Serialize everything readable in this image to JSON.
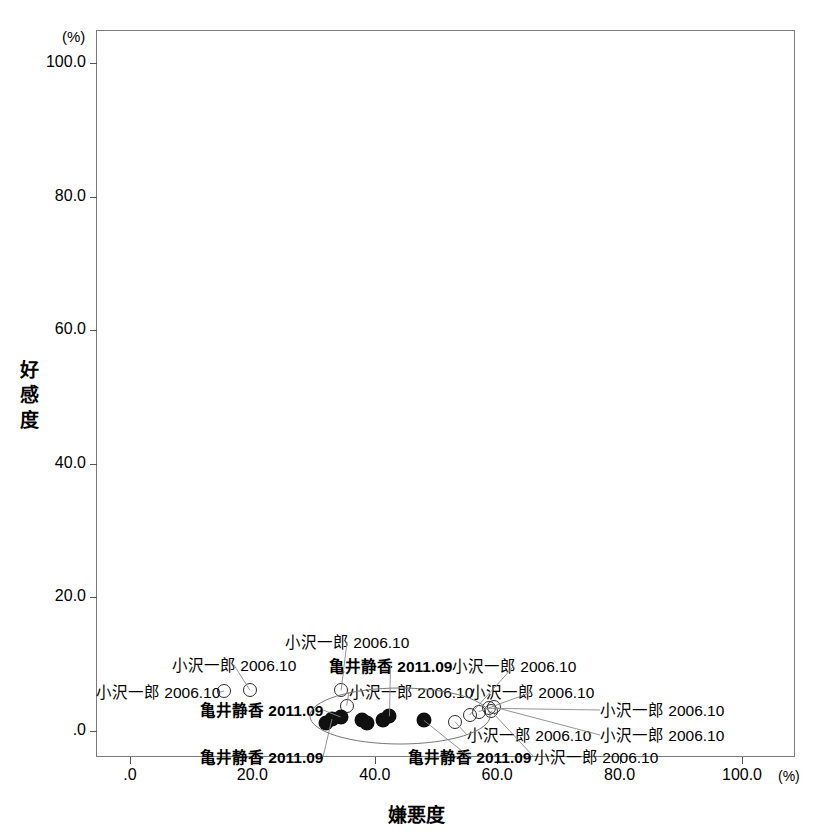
{
  "chart_data": {
    "type": "scatter",
    "title": "",
    "xlabel": "嫌悪度",
    "ylabel": "好感度",
    "x_unit": "(%)",
    "y_unit": "(%)",
    "xlim": [
      0,
      100
    ],
    "ylim": [
      0,
      100
    ],
    "xticks": [
      ".0",
      "20.0",
      "40.0",
      "60.0",
      "80.0",
      "100.0"
    ],
    "xtick_values": [
      0,
      20,
      40,
      60,
      80,
      100
    ],
    "yticks": [
      ".0",
      "20.0",
      "40.0",
      "60.0",
      "80.0",
      "100.0"
    ],
    "ytick_values": [
      0,
      20,
      40,
      60,
      80,
      100
    ],
    "grid": false,
    "legend": "none",
    "series": [
      {
        "name": "小沢一郎 2006.10",
        "marker": "open-circle",
        "points": [
          {
            "x": 15.4,
            "y": 6.0
          },
          {
            "x": 19.6,
            "y": 6.1
          },
          {
            "x": 34.5,
            "y": 6.1
          },
          {
            "x": 35.4,
            "y": 3.8
          },
          {
            "x": 55.5,
            "y": 2.4
          },
          {
            "x": 57.0,
            "y": 2.9
          },
          {
            "x": 58.6,
            "y": 3.4
          },
          {
            "x": 59.0,
            "y": 3.0
          },
          {
            "x": 59.4,
            "y": 3.6
          },
          {
            "x": 53.1,
            "y": 1.4
          }
        ]
      },
      {
        "name": "亀井静香 2011.09",
        "marker": "filled-circle",
        "points": [
          {
            "x": 32.0,
            "y": 1.2
          },
          {
            "x": 33.0,
            "y": 1.8
          },
          {
            "x": 34.4,
            "y": 2.1
          },
          {
            "x": 37.9,
            "y": 1.7
          },
          {
            "x": 38.8,
            "y": 1.2
          },
          {
            "x": 41.3,
            "y": 1.6
          },
          {
            "x": 42.4,
            "y": 2.2
          },
          {
            "x": 48.0,
            "y": 1.6
          }
        ]
      }
    ],
    "annotations": [
      {
        "text": "小沢一郎 2006.10",
        "x_px": 96,
        "y_px": 684,
        "bold": false,
        "target_x": 15.4,
        "target_y": 6.0
      },
      {
        "text": "小沢一郎 2006.10",
        "x_px": 172,
        "y_px": 657,
        "bold": false,
        "target_x": 19.6,
        "target_y": 6.1
      },
      {
        "text": "亀井静香 2011.09",
        "x_px": 200,
        "y_px": 702,
        "bold": true,
        "target_x": 34.4,
        "target_y": 2.1
      },
      {
        "text": "小沢一郎 2006.10",
        "x_px": 285,
        "y_px": 634,
        "bold": false,
        "target_x": 34.5,
        "target_y": 6.1
      },
      {
        "text": "亀井静香 2011.09",
        "x_px": 329,
        "y_px": 658,
        "bold": true,
        "target_x": 42.4,
        "target_y": 2.2
      },
      {
        "text": "小沢一郎 2006.10",
        "x_px": 349,
        "y_px": 684,
        "bold": false,
        "target_x": 35.4,
        "target_y": 3.8
      },
      {
        "text": "小沢一郎 2006.10",
        "x_px": 452,
        "y_px": 658,
        "bold": false,
        "target_x": 55.5,
        "target_y": 2.4
      },
      {
        "text": "小沢一郎 2006.10",
        "x_px": 470,
        "y_px": 684,
        "bold": false,
        "target_x": 57.0,
        "target_y": 2.9
      },
      {
        "text": "小沢一郎 2006.10",
        "x_px": 600,
        "y_px": 702,
        "bold": false,
        "target_x": 58.6,
        "target_y": 3.4
      },
      {
        "text": "小沢一郎 2006.10",
        "x_px": 600,
        "y_px": 727,
        "bold": false,
        "target_x": 59.4,
        "target_y": 3.6
      },
      {
        "text": "小沢一郎 2006.10",
        "x_px": 467,
        "y_px": 727,
        "bold": false,
        "target_x": 53.1,
        "target_y": 1.4
      },
      {
        "text": "亀井静香 2011.09",
        "x_px": 200,
        "y_px": 749,
        "bold": true,
        "target_x": 33.0,
        "target_y": 1.8
      },
      {
        "text": "亀井静香 2011.09",
        "x_px": 408,
        "y_px": 749,
        "bold": true,
        "target_x": 48.0,
        "target_y": 1.6
      },
      {
        "text": "小沢一郎 2006.10",
        "x_px": 534,
        "y_px": 749,
        "bold": false,
        "target_x": 59.0,
        "target_y": 3.0
      }
    ],
    "cluster_ellipse": {
      "cx_px": 400,
      "cy_px": 716,
      "rx_px": 90,
      "ry_px": 28
    }
  },
  "axes": {
    "y_title": "好感度",
    "y_title_chars": [
      "好",
      "感",
      "度"
    ],
    "x_title": "嫌悪度",
    "y_unit": "(%)",
    "x_unit": "(%)"
  }
}
